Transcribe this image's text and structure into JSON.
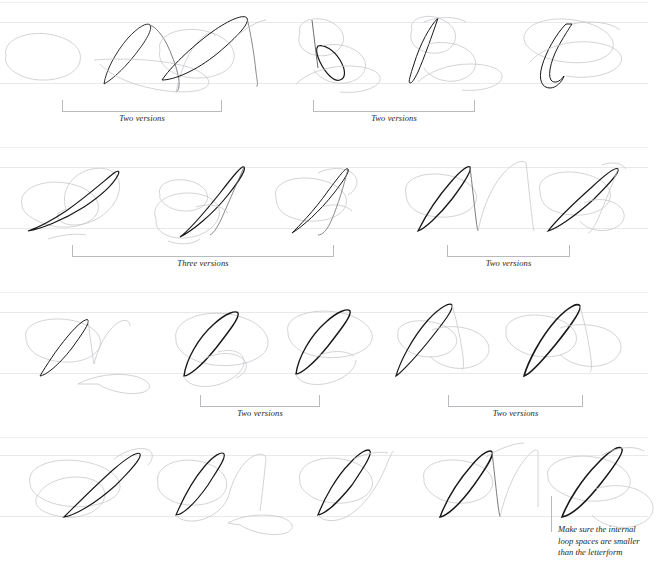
{
  "page": {
    "background": "#ffffff",
    "ink_dark": "#1a1718",
    "ink_light": "#b4b2b7",
    "guide_color": "#e9e9ec",
    "rule_color": "#b9b9be"
  },
  "rows": [
    {
      "id": "row-1",
      "letters": [
        "A",
        "A",
        "B",
        "B",
        "C"
      ],
      "annotations": [
        {
          "id": "r1-a1",
          "label": "Two versions",
          "left": 62,
          "width": 160,
          "top": 100
        },
        {
          "id": "r1-a2",
          "label": "Two versions",
          "left": 313,
          "width": 162,
          "top": 100
        }
      ]
    },
    {
      "id": "row-2",
      "letters": [
        "G",
        "G",
        "G",
        "N",
        "H"
      ],
      "annotations": [
        {
          "id": "r2-a1",
          "label": "Three versions",
          "left": 72,
          "width": 262,
          "top": 245
        },
        {
          "id": "r2-a2",
          "label": "Two versions",
          "left": 447,
          "width": 123,
          "top": 245
        }
      ]
    },
    {
      "id": "row-3",
      "letters": [
        "N",
        "O",
        "O",
        "P",
        "P"
      ],
      "annotations": [
        {
          "id": "r3-a1",
          "label": "Two versions",
          "left": 200,
          "width": 120,
          "top": 395
        },
        {
          "id": "r3-a2",
          "label": "Two versions",
          "left": 448,
          "width": 135,
          "top": 395
        }
      ]
    },
    {
      "id": "row-4",
      "letters": [
        "T",
        "U",
        "V",
        "W",
        "X"
      ],
      "annotations": []
    }
  ],
  "callout": {
    "id": "loop-space-note",
    "text": "Make sure the internal loop spaces are smaller than the letterform",
    "lines": [
      "Make sure the internal",
      "loop spaces are smaller",
      "than the letterform"
    ]
  }
}
